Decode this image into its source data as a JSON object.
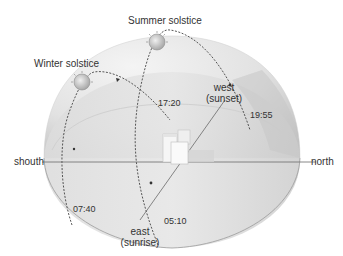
{
  "diagram": {
    "type": "sun-path-hemisphere",
    "directions": {
      "south": "shouth",
      "north": "north",
      "east": "east",
      "east_sub": "(sunrise)",
      "west": "west",
      "west_sub": "(sunset)"
    },
    "paths": [
      {
        "name": "Summer solstice",
        "sunrise": "05:10",
        "sunset": "19:55"
      },
      {
        "name": "Winter solstice",
        "sunrise": "07:40",
        "sunset": "17:20"
      }
    ],
    "labels": {
      "summer": "Summer solstice",
      "winter": "Winter solstice",
      "t_1720": "17:20",
      "t_1955": "19:55",
      "t_0740": "07:40",
      "t_0510": "05:10"
    },
    "colors": {
      "dome_light": "#ececec",
      "dome_mid": "#d6d6d6",
      "dome_dark": "#bdbdbd",
      "path": "#444444",
      "sun": "#b8b8b8",
      "text": "#333333"
    }
  }
}
